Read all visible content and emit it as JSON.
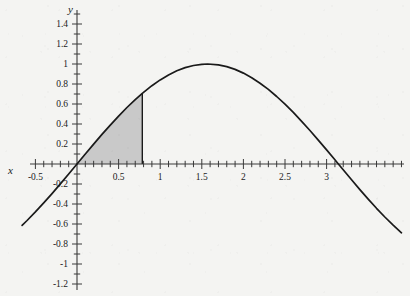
{
  "chart_data": {
    "type": "line",
    "title": "",
    "subtitle": "",
    "xlabel": "x",
    "ylabel": "y",
    "function": "y = sin(x)",
    "grid": false,
    "legend": "none",
    "xlim": [
      -0.78,
      4.0
    ],
    "ylim": [
      -1.32,
      1.5
    ],
    "x_major_ticks": [
      -0.5,
      0.5,
      1,
      1.5,
      2,
      2.5,
      3
    ],
    "x_major_tick_labels": [
      "-0.5",
      "0.5",
      "1",
      "1.5",
      "2",
      "2.5",
      "3"
    ],
    "x_minor_tick_step": 0.1,
    "y_major_ticks": [
      -1.2,
      -1,
      -0.8,
      -0.6,
      -0.4,
      -0.2,
      0.2,
      0.4,
      0.6,
      0.8,
      1,
      1.2,
      1.4
    ],
    "y_major_tick_labels": [
      "-1.2",
      "-1",
      "-0.8",
      "-0.6",
      "-0.4",
      "-0.2",
      "0.2",
      "0.4",
      "0.6",
      "0.8",
      "1",
      "1.2",
      "1.4"
    ],
    "y_minor_tick_step": 0.1,
    "series": [
      {
        "name": "sin(x)",
        "color": "#1a1a1a",
        "x": [
          -0.66,
          -0.6,
          -0.5,
          -0.4,
          -0.3,
          -0.2,
          -0.1,
          0,
          0.1,
          0.2,
          0.3,
          0.4,
          0.5,
          0.6,
          0.7,
          0.785,
          0.9,
          1,
          1.1,
          1.2,
          1.3,
          1.4,
          1.5,
          1.5708,
          1.7,
          1.8,
          1.9,
          2,
          2.1,
          2.2,
          2.3,
          2.4,
          2.5,
          2.6,
          2.7,
          2.8,
          2.9,
          3,
          3.1,
          3.1416,
          3.3,
          3.4,
          3.5,
          3.6,
          3.7,
          3.8,
          3.9
        ],
        "y": [
          -0.613,
          -0.565,
          -0.479,
          -0.389,
          -0.296,
          -0.199,
          -0.1,
          0,
          0.1,
          0.199,
          0.296,
          0.389,
          0.479,
          0.565,
          0.644,
          0.707,
          0.783,
          0.841,
          0.891,
          0.932,
          0.964,
          0.985,
          0.997,
          1,
          0.992,
          0.974,
          0.946,
          0.909,
          0.863,
          0.808,
          0.746,
          0.675,
          0.598,
          0.516,
          0.427,
          0.335,
          0.239,
          0.141,
          0.042,
          0,
          -0.158,
          -0.256,
          -0.351,
          -0.443,
          -0.53,
          -0.612,
          -0.688
        ]
      }
    ],
    "shaded_region": {
      "label": "area under sin(x)",
      "x_start": 0,
      "x_end": 0.785,
      "y_at_x_end": 0.707,
      "fill_color": "#c9c9c9",
      "edge_color": "#1a1a1a"
    },
    "zero_crossings": [
      0,
      3.1416
    ],
    "maximum": {
      "x": 1.5708,
      "y": 1
    },
    "background_color": "#f4f4f2",
    "axis_color": "#3a3a3a"
  }
}
